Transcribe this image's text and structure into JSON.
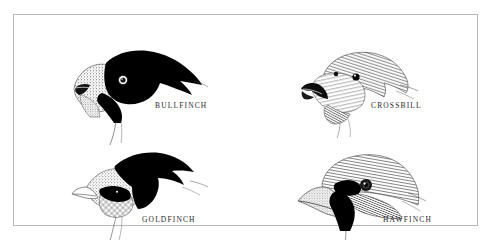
{
  "plate": {
    "background_color": "#ffffff",
    "frame_color": "#b9b9bb",
    "ink_color": "#000000",
    "caption_color": "#2a2a2a"
  },
  "figures": [
    {
      "id": "bullfinch",
      "caption": "BULLFINCH",
      "subject": "bullfinch-head",
      "description": "Pen and ink head study of a bullfinch in left profile with black cap, black bib and stippled cheek."
    },
    {
      "id": "crossbill",
      "caption": "CROSSBILL",
      "subject": "crossbill-head",
      "description": "Pen and ink head study of a crossbill in left profile rendered in fine hatching with crossed mandibles."
    },
    {
      "id": "goldfinch",
      "caption": "GOLDFINCH",
      "subject": "goldfinch-head",
      "description": "Pen and ink head study of a goldfinch in left profile with black crown band sweeping to the nape and pale conical bill."
    },
    {
      "id": "hawfinch",
      "caption": "HAWFINCH",
      "subject": "hawfinch-head",
      "description": "Pen and ink head study of a hawfinch in left profile with massive conical bill, black eye mask and black throat."
    }
  ]
}
